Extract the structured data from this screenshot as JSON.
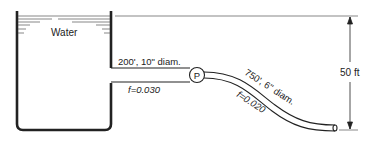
{
  "diagram": {
    "tank": {
      "label": "Water"
    },
    "pipe1": {
      "length_label": "200', 10\" diam.",
      "friction_label": "f=0.030"
    },
    "pump": {
      "label": "P"
    },
    "pipe2": {
      "length_label": "750', 6\" diam.",
      "friction_label": "f=0.020"
    },
    "elevation": {
      "label": "50 ft"
    },
    "colors": {
      "line": "#222222",
      "background": "#ffffff"
    }
  }
}
